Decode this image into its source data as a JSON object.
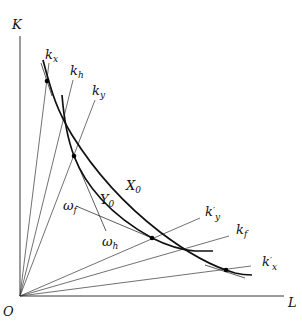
{
  "diagram": {
    "axes": {
      "vertical_label": "K",
      "horizontal_label": "L",
      "origin_label": "O"
    },
    "rays": [
      {
        "id": "k_x",
        "base": "k",
        "sub": "x",
        "prime": false
      },
      {
        "id": "k_h",
        "base": "k",
        "sub": "h",
        "prime": false
      },
      {
        "id": "k_y",
        "base": "k",
        "sub": "y",
        "prime": false
      },
      {
        "id": "k'_y",
        "base": "k",
        "sub": "y",
        "prime": true
      },
      {
        "id": "k_f",
        "base": "k",
        "sub": "f",
        "prime": false
      },
      {
        "id": "k'_x",
        "base": "k",
        "sub": "x",
        "prime": true
      }
    ],
    "isoquants": [
      {
        "id": "X0",
        "base": "X",
        "sub": "0"
      },
      {
        "id": "Y0",
        "base": "Y",
        "sub": "0"
      }
    ],
    "factor_price_lines": [
      {
        "id": "omega_f",
        "base": "ω",
        "sub": "f"
      },
      {
        "id": "omega_h",
        "base": "ω",
        "sub": "h"
      }
    ],
    "colors": {
      "line": "#111111",
      "background": "#ffffff"
    }
  }
}
